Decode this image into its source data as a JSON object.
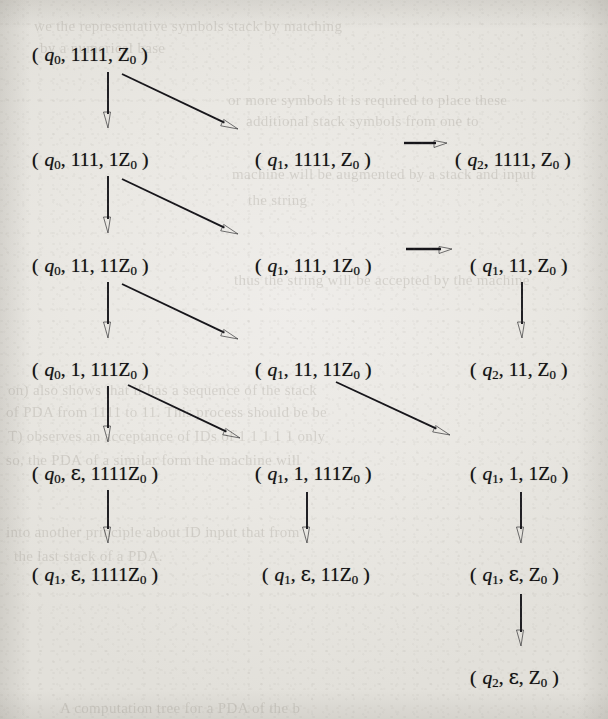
{
  "page": {
    "kind": "scanned-textbook-figure",
    "width": 608,
    "height": 719,
    "ink_color": "#111012",
    "paper_color": "#eae8e3"
  },
  "nodes": [
    {
      "id": "n0",
      "row": 1,
      "col": 1,
      "state": "q",
      "state_sub": "0",
      "input": "1111",
      "stack": "Z",
      "stack_sub": "0",
      "x": 32,
      "y": 45
    },
    {
      "id": "n1",
      "row": 2,
      "col": 1,
      "state": "q",
      "state_sub": "0",
      "input": "111",
      "stack": "1Z",
      "stack_sub": "0",
      "x": 32,
      "y": 150
    },
    {
      "id": "n2",
      "row": 2,
      "col": 2,
      "state": "q",
      "state_sub": "1",
      "input": "1111",
      "stack": "Z",
      "stack_sub": "0",
      "x": 255,
      "y": 150
    },
    {
      "id": "n3",
      "row": 2,
      "col": 3,
      "state": "q",
      "state_sub": "2",
      "input": "1111",
      "stack": "Z",
      "stack_sub": "0",
      "x": 455,
      "y": 150
    },
    {
      "id": "n4",
      "row": 3,
      "col": 1,
      "state": "q",
      "state_sub": "0",
      "input": "11",
      "stack": "11Z",
      "stack_sub": "0",
      "x": 32,
      "y": 256
    },
    {
      "id": "n5",
      "row": 3,
      "col": 2,
      "state": "q",
      "state_sub": "1",
      "input": "111",
      "stack": "1Z",
      "stack_sub": "0",
      "x": 255,
      "y": 256
    },
    {
      "id": "n6",
      "row": 3,
      "col": 3,
      "state": "q",
      "state_sub": "1",
      "input": "11",
      "stack": "Z",
      "stack_sub": "0",
      "x": 470,
      "y": 256
    },
    {
      "id": "n7",
      "row": 4,
      "col": 1,
      "state": "q",
      "state_sub": "0",
      "input": "1",
      "stack": "111Z",
      "stack_sub": "0",
      "x": 32,
      "y": 360
    },
    {
      "id": "n8",
      "row": 4,
      "col": 2,
      "state": "q",
      "state_sub": "1",
      "input": "11",
      "stack": "11Z",
      "stack_sub": "0",
      "x": 255,
      "y": 360
    },
    {
      "id": "n9",
      "row": 4,
      "col": 3,
      "state": "q",
      "state_sub": "2",
      "input": "11",
      "stack": "Z",
      "stack_sub": "0",
      "x": 470,
      "y": 360
    },
    {
      "id": "n10",
      "row": 5,
      "col": 1,
      "state": "q",
      "state_sub": "0",
      "input": "ε",
      "stack": "1111Z",
      "stack_sub": "0",
      "x": 32,
      "y": 464
    },
    {
      "id": "n11",
      "row": 5,
      "col": 2,
      "state": "q",
      "state_sub": "1",
      "input": "1",
      "stack": "111Z",
      "stack_sub": "0",
      "x": 255,
      "y": 464
    },
    {
      "id": "n12",
      "row": 5,
      "col": 3,
      "state": "q",
      "state_sub": "1",
      "input": "1",
      "stack": "1Z",
      "stack_sub": "0",
      "x": 470,
      "y": 464
    },
    {
      "id": "n13",
      "row": 6,
      "col": 1,
      "state": "q",
      "state_sub": "1",
      "input": "ε",
      "stack": "1111Z",
      "stack_sub": "0",
      "x": 32,
      "y": 565
    },
    {
      "id": "n14",
      "row": 6,
      "col": 2,
      "state": "q",
      "state_sub": "1",
      "input": "ε",
      "stack": "11Z",
      "stack_sub": "0",
      "x": 262,
      "y": 565
    },
    {
      "id": "n15",
      "row": 6,
      "col": 3,
      "state": "q",
      "state_sub": "1",
      "input": "ε",
      "stack": "Z",
      "stack_sub": "0",
      "x": 470,
      "y": 565
    },
    {
      "id": "n16",
      "row": 7,
      "col": 3,
      "state": "q",
      "state_sub": "2",
      "input": "ε",
      "stack": "Z",
      "stack_sub": "0",
      "x": 470,
      "y": 668
    }
  ],
  "edges": [
    {
      "id": "e1",
      "kind": "vertical",
      "from": "n0",
      "to": "n1",
      "x1": 108,
      "y1": 72,
      "x2": 108,
      "y2": 128
    },
    {
      "id": "e2",
      "kind": "diagonal",
      "from": "n0",
      "to": "n2",
      "x1": 122,
      "y1": 74,
      "x2": 238,
      "y2": 129
    },
    {
      "id": "e3",
      "kind": "horizontal",
      "from": "n2",
      "to": "n3",
      "x1": 404,
      "y1": 143,
      "x2": 447,
      "y2": 143
    },
    {
      "id": "e4",
      "kind": "vertical",
      "from": "n1",
      "to": "n4",
      "x1": 108,
      "y1": 176,
      "x2": 108,
      "y2": 233
    },
    {
      "id": "e5",
      "kind": "diagonal",
      "from": "n1",
      "to": "n5",
      "x1": 122,
      "y1": 179,
      "x2": 238,
      "y2": 234
    },
    {
      "id": "e6",
      "kind": "horizontal",
      "from": "n5",
      "to": "n6",
      "x1": 406,
      "y1": 249,
      "x2": 452,
      "y2": 249
    },
    {
      "id": "e7",
      "kind": "vertical",
      "from": "n4",
      "to": "n7",
      "x1": 108,
      "y1": 282,
      "x2": 108,
      "y2": 338
    },
    {
      "id": "e8",
      "kind": "diagonal",
      "from": "n4",
      "to": "n8",
      "x1": 122,
      "y1": 284,
      "x2": 238,
      "y2": 339
    },
    {
      "id": "e9",
      "kind": "vertical",
      "from": "n6",
      "to": "n9",
      "x1": 522,
      "y1": 282,
      "x2": 522,
      "y2": 338
    },
    {
      "id": "e10",
      "kind": "vertical",
      "from": "n7",
      "to": "n10",
      "x1": 108,
      "y1": 386,
      "x2": 108,
      "y2": 442
    },
    {
      "id": "e11",
      "kind": "diagonal",
      "from": "n7",
      "to": "n11",
      "x1": 128,
      "y1": 385,
      "x2": 240,
      "y2": 438
    },
    {
      "id": "e12",
      "kind": "diagonal",
      "from": "n8",
      "to": "n12",
      "x1": 336,
      "y1": 382,
      "x2": 450,
      "y2": 435
    },
    {
      "id": "e13",
      "kind": "vertical",
      "from": "n10",
      "to": "n13",
      "x1": 108,
      "y1": 490,
      "x2": 108,
      "y2": 543
    },
    {
      "id": "e14",
      "kind": "vertical",
      "from": "n11",
      "to": "n14",
      "x1": 307,
      "y1": 492,
      "x2": 307,
      "y2": 543
    },
    {
      "id": "e15",
      "kind": "vertical",
      "from": "n12",
      "to": "n15",
      "x1": 521,
      "y1": 492,
      "x2": 521,
      "y2": 543
    },
    {
      "id": "e16",
      "kind": "vertical",
      "from": "n15",
      "to": "n16",
      "x1": 521,
      "y1": 594,
      "x2": 521,
      "y2": 646
    }
  ],
  "bleed_text": [
    {
      "text": "we the representative symbols stack by matching",
      "x": 34,
      "y": 18,
      "size": 15
    },
    {
      "text": "by a numerical base",
      "x": 40,
      "y": 40,
      "size": 15
    },
    {
      "text": "or more symbols    it is required to place these",
      "x": 228,
      "y": 92,
      "size": 15
    },
    {
      "text": "additional stack symbols from one to",
      "x": 246,
      "y": 113,
      "size": 15
    },
    {
      "text": "machine will be augmented by a stack and input",
      "x": 232,
      "y": 166,
      "size": 15
    },
    {
      "text": "the string",
      "x": 248,
      "y": 192,
      "size": 15
    },
    {
      "text": "thus the string will be accepted by the machine",
      "x": 234,
      "y": 272,
      "size": 15
    },
    {
      "text": "on) also shows that if has a sequence of the stack",
      "x": 8,
      "y": 382,
      "size": 15
    },
    {
      "text": "of PDA from 1111 to 11. This process should be be",
      "x": 6,
      "y": 404,
      "size": 15
    },
    {
      "text": "T) observes an acceptance of IDs of 1 1 1 1 1 only",
      "x": 8,
      "y": 428,
      "size": 15
    },
    {
      "text": "so, the PDA of a similar form the machine will",
      "x": 6,
      "y": 452,
      "size": 15
    },
    {
      "text": "into another principle about ID input that from",
      "x": 6,
      "y": 524,
      "size": 15
    },
    {
      "text": "the last stack of a PDA.",
      "x": 14,
      "y": 548,
      "size": 15
    },
    {
      "text": "A computation tree for a PDA of the b",
      "x": 60,
      "y": 700,
      "size": 15
    }
  ]
}
